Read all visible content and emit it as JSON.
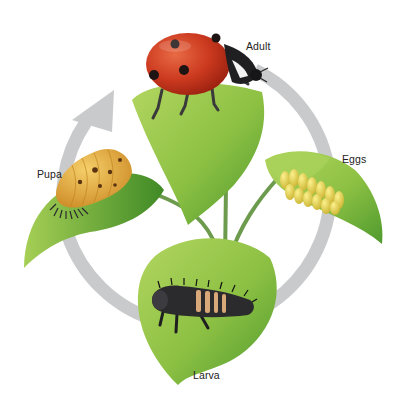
{
  "diagram": {
    "cycle_direction": "Eggs → Larva → Pupa → Adult",
    "colors": {
      "background": "#ffffff",
      "cycle_arrow": "#c9cacb",
      "leaf_light": "#9cc84a",
      "leaf_dark": "#4f9a2e",
      "stem": "#6d9b4e",
      "ladybug_red": "#c8311c",
      "egg_yellow": "#e6d24a",
      "pupa_orange": "#e0a43a",
      "larva_black": "#2b2b2e"
    },
    "stages": [
      {
        "id": "adult",
        "label": "Adult"
      },
      {
        "id": "eggs",
        "label": "Eggs"
      },
      {
        "id": "larva",
        "label": "Larva"
      },
      {
        "id": "pupa",
        "label": "Pupa"
      }
    ]
  }
}
